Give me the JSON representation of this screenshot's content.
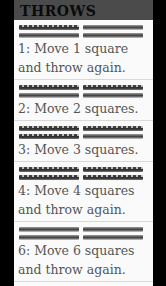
{
  "header": {
    "title": "THROWS"
  },
  "throws": [
    {
      "marked": [
        true,
        false,
        false,
        false
      ],
      "line1": "1: Move 1 square",
      "line2": "and throw again."
    },
    {
      "marked": [
        true,
        true,
        false,
        false
      ],
      "line1": "2: Move 2 squares.",
      "line2": null
    },
    {
      "marked": [
        true,
        true,
        true,
        false
      ],
      "line1": "3: Move 3 squares.",
      "line2": null
    },
    {
      "marked": [
        true,
        true,
        true,
        true
      ],
      "line1": "4: Move 4 squares",
      "line2": "and throw again."
    },
    {
      "marked": [
        false,
        false,
        false,
        false
      ],
      "line1": "6: Move 6 squares",
      "line2": "and throw again."
    }
  ]
}
